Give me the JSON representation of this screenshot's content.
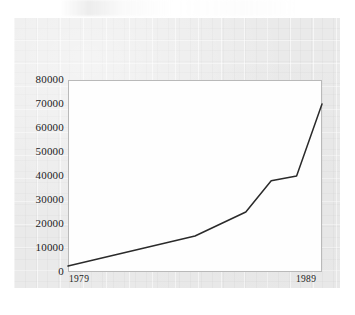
{
  "figure": {
    "background_color": "#eaeaea",
    "plot_background_color": "#fefefe",
    "frame_color": "#b9b9b9",
    "line_color": "#2a2a2a"
  },
  "chart_data": {
    "type": "line",
    "title": "",
    "subtitle": "",
    "xlabel": "",
    "ylabel": "",
    "x": [
      1979,
      1980,
      1981,
      1982,
      1983,
      1984,
      1985,
      1986,
      1987,
      1988,
      1989
    ],
    "values": [
      2500,
      5000,
      7500,
      10000,
      12500,
      15000,
      20000,
      25000,
      38000,
      40000,
      70000
    ],
    "series": [
      {
        "name": "series-1",
        "values": [
          2500,
          5000,
          7500,
          10000,
          12500,
          15000,
          20000,
          25000,
          38000,
          40000,
          70000
        ]
      }
    ],
    "xlim": [
      1979,
      1989
    ],
    "ylim": [
      0,
      80000
    ],
    "ytick_labels": [
      "0",
      "10000",
      "20000",
      "30000",
      "40000",
      "50000",
      "60000",
      "70000",
      "80000"
    ],
    "ytick_values": [
      0,
      10000,
      20000,
      30000,
      40000,
      50000,
      60000,
      70000,
      80000
    ],
    "xtick_labels": [
      "1979",
      "1989"
    ],
    "xtick_values": [
      1979,
      1989
    ],
    "grid": false,
    "legend": false,
    "legend_position": "none",
    "markers": false,
    "annotations": []
  }
}
